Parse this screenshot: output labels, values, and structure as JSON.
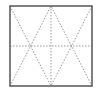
{
  "diagram": {
    "frame": {
      "x": 10,
      "y": 6,
      "width": 82,
      "height": 80,
      "stroke": "#555555",
      "stroke_width": 1.5
    },
    "guide_color": "#9a9a9a",
    "lines": [
      {
        "name": "vertical-midline",
        "x1": 51,
        "y1": 6,
        "x2": 51,
        "y2": 86
      },
      {
        "name": "horizontal-midline",
        "x1": 10,
        "y1": 46,
        "x2": 92,
        "y2": 46
      },
      {
        "name": "diagonal-tl-to-bc",
        "x1": 10,
        "y1": 6,
        "x2": 51,
        "y2": 86
      },
      {
        "name": "diagonal-tr-to-bc",
        "x1": 92,
        "y1": 6,
        "x2": 51,
        "y2": 86
      },
      {
        "name": "diagonal-bl-to-tc",
        "x1": 10,
        "y1": 86,
        "x2": 51,
        "y2": 6
      },
      {
        "name": "diagonal-br-to-tc",
        "x1": 92,
        "y1": 86,
        "x2": 51,
        "y2": 6
      }
    ]
  }
}
